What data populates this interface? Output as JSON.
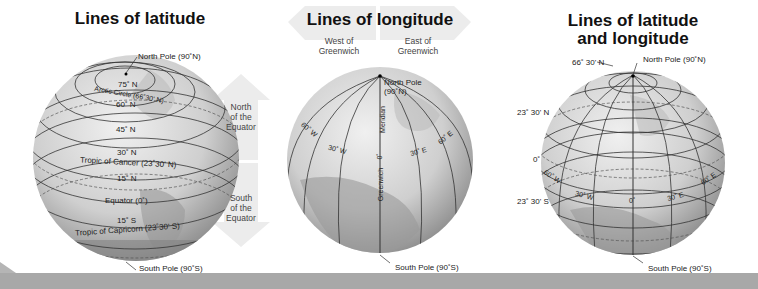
{
  "panels": [
    {
      "title": "Lines of latitude",
      "labels": {
        "north_pole": "North Pole (90˚N)",
        "south_pole": "South Pole (90˚S)",
        "lat_75n": "75˚ N",
        "arctic_circle": "Arctic Circle (66˚30' N)",
        "lat_60n": "60˚ N",
        "lat_45n": "45˚ N",
        "lat_30n": "30˚ N",
        "tropic_cancer": "Tropic of Cancer (23˚30' N)",
        "lat_15n": "15˚ N",
        "equator": "Equator (0˚)",
        "lat_15s": "15˚ S",
        "tropic_capricorn": "Tropic of Capricorn (23˚30' S)"
      },
      "arrows": {
        "north": "North\nof the\nEquator",
        "south": "South\nof the\nEquator"
      }
    },
    {
      "title": "Lines of longitude",
      "labels": {
        "north_pole": "North Pole\n(90˚N)",
        "south_pole": "South Pole (90˚S)",
        "lon_60w": "60˚ W",
        "lon_30w": "30˚ W",
        "lon_0": "0˚",
        "lon_30e": "30˚ E",
        "lon_60e": "60˚ E",
        "meridian": "Meridian",
        "greenwich": "Greenwich"
      },
      "arrows": {
        "west": "West of\nGreenwich",
        "east": "East of\nGreenwich"
      }
    },
    {
      "title": "Lines of latitude\nand longitude",
      "labels": {
        "north_pole": "North Pole (90˚N)",
        "south_pole": "South Pole (90˚S)",
        "lat_66n": "66˚ 30' N",
        "lat_23n": "23˚ 30' N",
        "lat_0": "0˚",
        "lat_23s": "23˚ 30' S",
        "lon_60w": "60˚ W",
        "lon_30w": "30˚ W",
        "lon_0": "0˚",
        "lon_30e": "30˚ E",
        "lon_60e": "60˚ E"
      }
    }
  ],
  "colors": {
    "globe_light": "#e6e6e6",
    "globe_dark": "#8f8f8f",
    "land": "#a9a9a9",
    "arrow_fill": "#ececec",
    "banner": "#a8a8a8"
  }
}
